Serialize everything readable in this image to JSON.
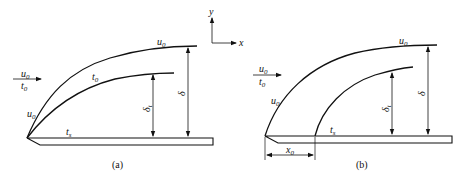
{
  "figure": {
    "panels": [
      {
        "id": "a",
        "caption": "(a)",
        "freestream": {
          "velocity": "u",
          "velocity_sub": "0",
          "temperature": "t",
          "temperature_sub": "0"
        },
        "outer_curve_label_near": {
          "base": "u",
          "sub": "0"
        },
        "outer_curve_label_top": {
          "base": "u",
          "sub": "0"
        },
        "inner_curve_label": {
          "base": "t",
          "sub": "0"
        },
        "surface_label": {
          "base": "t",
          "sub": "s"
        },
        "thermal_thickness": {
          "base": "δ",
          "sub": "t"
        },
        "velocity_thickness": {
          "base": "δ"
        }
      },
      {
        "id": "b",
        "caption": "(b)",
        "freestream": {
          "velocity": "u",
          "velocity_sub": "0",
          "temperature": "t",
          "temperature_sub": "0"
        },
        "outer_curve_label_near": {
          "base": "u",
          "sub": "0"
        },
        "outer_curve_label_top": {
          "base": "u",
          "sub": "0"
        },
        "surface_label": {
          "base": "t",
          "sub": "s"
        },
        "thermal_thickness": {
          "base": "δ",
          "sub": "t"
        },
        "velocity_thickness": {
          "base": "δ"
        },
        "offset": {
          "base": "x",
          "sub": "0"
        }
      }
    ],
    "axes": {
      "x": "x",
      "y": "y"
    }
  }
}
